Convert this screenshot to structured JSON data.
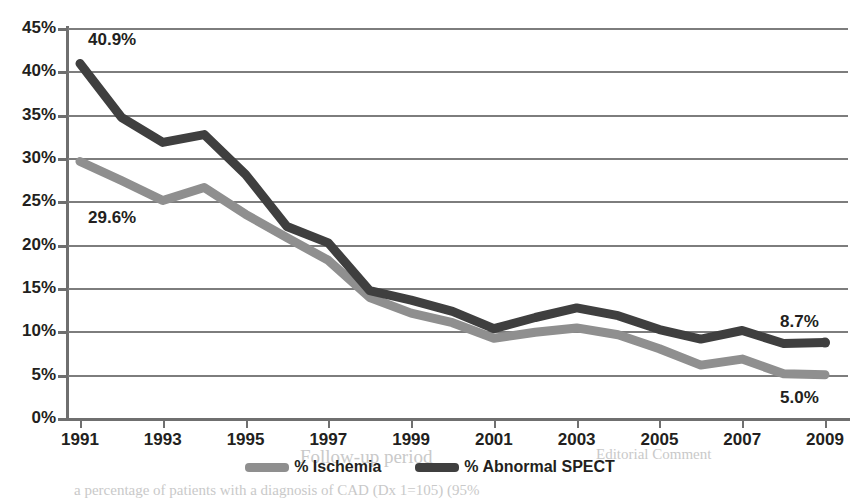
{
  "chart_data": {
    "type": "line",
    "title": "",
    "xlabel": "",
    "ylabel": "",
    "x": [
      1991,
      1992,
      1993,
      1994,
      1995,
      1996,
      1997,
      1998,
      1999,
      2000,
      2001,
      2002,
      2003,
      2004,
      2005,
      2006,
      2007,
      2008,
      2009
    ],
    "xtick_labels": [
      "1991",
      "1993",
      "1995",
      "1997",
      "1999",
      "2001",
      "2003",
      "2005",
      "2007",
      "2009"
    ],
    "xtick_values": [
      1991,
      1993,
      1995,
      1997,
      1999,
      2001,
      2003,
      2005,
      2007,
      2009
    ],
    "ytick_labels": [
      "0%",
      "5%",
      "10%",
      "15%",
      "20%",
      "25%",
      "30%",
      "35%",
      "40%",
      "45%"
    ],
    "ytick_values": [
      0,
      5,
      10,
      15,
      20,
      25,
      30,
      35,
      40,
      45
    ],
    "ylim": [
      0,
      45
    ],
    "xlim": [
      1991,
      2009
    ],
    "grid": "horizontal",
    "legend_position": "bottom-center",
    "series": [
      {
        "name": "% Ischemia",
        "color": "#8f8f8f",
        "values": [
          29.6,
          27.4,
          25.1,
          26.6,
          23.5,
          20.8,
          18.2,
          13.9,
          12.1,
          11.0,
          9.2,
          9.9,
          10.4,
          9.6,
          8.0,
          6.1,
          6.8,
          5.1,
          5.0
        ]
      },
      {
        "name": "% Abnormal SPECT",
        "color": "#3f3f3f",
        "values": [
          40.9,
          34.7,
          31.8,
          32.7,
          28.1,
          22.1,
          20.2,
          14.7,
          13.6,
          12.3,
          10.3,
          11.6,
          12.7,
          11.8,
          10.2,
          9.1,
          10.1,
          8.6,
          8.7
        ]
      }
    ],
    "annotations": [
      {
        "text": "40.9%",
        "series": "% Abnormal SPECT",
        "x": 1991,
        "value": 40.9,
        "position": "above-right"
      },
      {
        "text": "29.6%",
        "series": "% Ischemia",
        "x": 1991,
        "value": 29.6,
        "position": "below-right"
      },
      {
        "text": "8.7%",
        "series": "% Abnormal SPECT",
        "x": 2009,
        "value": 8.7,
        "position": "above-left"
      },
      {
        "text": "5.0%",
        "series": "% Ischemia",
        "x": 2009,
        "value": 5.0,
        "position": "below-left"
      }
    ]
  },
  "legend": {
    "items": [
      {
        "label": "% Ischemia",
        "color": "#8f8f8f"
      },
      {
        "label": "% Abnormal SPECT",
        "color": "#3f3f3f"
      }
    ]
  },
  "axes": {
    "y_labels": [
      "45%",
      "40%",
      "35%",
      "30%",
      "25%",
      "20%",
      "15%",
      "10%",
      "5%",
      "0%"
    ],
    "x_labels": [
      "1991",
      "1993",
      "1995",
      "1997",
      "1999",
      "2001",
      "2003",
      "2005",
      "2007",
      "2009"
    ]
  },
  "annotations": {
    "start_abnormal": "40.9%",
    "start_ischemia": "29.6%",
    "end_abnormal": "8.7%",
    "end_ischemia": "5.0%"
  },
  "bleed_text": {
    "followup": "Follow-up period",
    "bottom": "a percentage of patients with a diagnosis of CAD (Dx 1=105) (95%",
    "top_right": "Editorial Comment"
  },
  "colors": {
    "ischemia": "#8f8f8f",
    "abnormal_spect": "#3f3f3f",
    "gridline": "#7d7d7d",
    "axis": "#6f6f6f",
    "text": "#231f20",
    "background": "#ffffff"
  }
}
